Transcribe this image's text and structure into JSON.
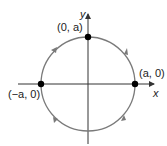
{
  "diagram": {
    "type": "unit-circle-parametric",
    "axes": {
      "x_label": "x",
      "y_label": "y"
    },
    "points": [
      {
        "label": "(0, a)"
      },
      {
        "label": "(a, 0)"
      },
      {
        "label": "(−a, 0)"
      }
    ],
    "direction": "counterclockwise",
    "colors": {
      "circle": "#7a7a7a",
      "axes": "#333333",
      "points": "#000000"
    }
  }
}
